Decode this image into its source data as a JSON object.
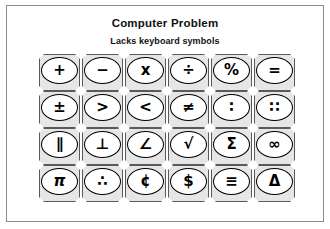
{
  "page": {
    "title": "Computer Problem",
    "subtitle": "Lacks keyboard symbols"
  },
  "colors": {
    "frame_border": "#8d8d8d",
    "key_cap_fill": "#e6e6e6",
    "key_cap_border": "#5a5a5a",
    "key_face_fill": "#ffffff",
    "key_face_border": "#000000",
    "glyph_color": "#000000",
    "page_background": "#ffffff"
  },
  "keypad": {
    "rows": 4,
    "columns": 6,
    "keys": [
      {
        "name": "key-plus",
        "glyph": "+",
        "label": "plus"
      },
      {
        "name": "key-minus",
        "glyph": "−",
        "label": "minus"
      },
      {
        "name": "key-multiply",
        "glyph": "x",
        "label": "multiply"
      },
      {
        "name": "key-divide",
        "glyph": "÷",
        "label": "divide"
      },
      {
        "name": "key-percent",
        "glyph": "%",
        "label": "percent"
      },
      {
        "name": "key-equals",
        "glyph": "=",
        "label": "equals"
      },
      {
        "name": "key-plus-minus",
        "glyph": "±",
        "label": "plus-minus"
      },
      {
        "name": "key-greater-than",
        "glyph": ">",
        "label": "greater than"
      },
      {
        "name": "key-less-than",
        "glyph": "<",
        "label": "less than"
      },
      {
        "name": "key-not-equal",
        "glyph": "≠",
        "label": "not equal"
      },
      {
        "name": "key-ratio",
        "glyph": "∶",
        "label": "ratio"
      },
      {
        "name": "key-proportion",
        "glyph": "∷",
        "label": "proportion"
      },
      {
        "name": "key-parallel",
        "glyph": "∥",
        "label": "parallel"
      },
      {
        "name": "key-perpendicular",
        "glyph": "⊥",
        "label": "perpendicular"
      },
      {
        "name": "key-angle",
        "glyph": "∠",
        "label": "angle"
      },
      {
        "name": "key-radical",
        "glyph": "√",
        "label": "square root"
      },
      {
        "name": "key-sigma",
        "glyph": "Σ",
        "label": "sigma summation"
      },
      {
        "name": "key-infinity",
        "glyph": "∞",
        "label": "infinity"
      },
      {
        "name": "key-pi",
        "glyph": "π",
        "label": "pi"
      },
      {
        "name": "key-therefore",
        "glyph": "∴",
        "label": "therefore"
      },
      {
        "name": "key-cent",
        "glyph": "¢",
        "label": "cent"
      },
      {
        "name": "key-dollar",
        "glyph": "$",
        "label": "dollar"
      },
      {
        "name": "key-identical",
        "glyph": "≡",
        "label": "identical to"
      },
      {
        "name": "key-delta",
        "glyph": "Δ",
        "label": "delta"
      }
    ]
  }
}
